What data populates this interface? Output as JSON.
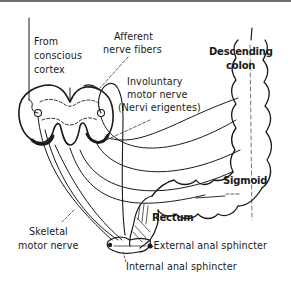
{
  "diagram": {
    "colors": {
      "ink": "#1a1a1a",
      "background": "#ffffff",
      "frame_rule": "#6f6f6f"
    },
    "labels": {
      "from_cortex": [
        "From",
        "conscious",
        "cortex"
      ],
      "afferent": [
        "Afferent",
        "nerve fibers"
      ],
      "involuntary": [
        "Involuntary",
        "motor nerve",
        "(Nervi erigentes)"
      ],
      "descending_colon": [
        "Descending",
        "colon"
      ],
      "sigmoid": "Sigmoid",
      "rectum": "Rectum",
      "skeletal": [
        "Skeletal",
        "motor nerve"
      ],
      "external_sphincter": "-External anal sphincter",
      "internal_sphincter": "Internal anal sphincter"
    },
    "structures": [
      "spinal-cord-cross-section",
      "descending-colon",
      "sigmoid-colon",
      "rectum",
      "anal-sphincters",
      "nerve-pathways"
    ]
  }
}
